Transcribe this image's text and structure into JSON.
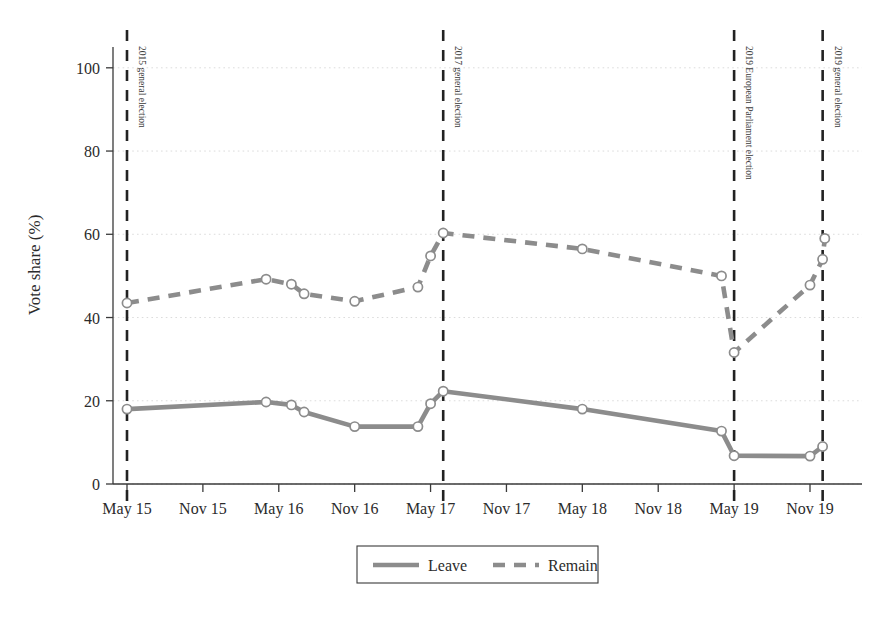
{
  "chart_data": {
    "type": "line",
    "title": "",
    "subtitle": "",
    "xlabel": "",
    "ylabel": "Vote share (%)",
    "ylim": [
      0,
      105
    ],
    "yticks": [
      0,
      20,
      40,
      60,
      80,
      100
    ],
    "ytick_labels": [
      "0",
      "20",
      "40",
      "60",
      "80",
      "100"
    ],
    "xlim": [
      "2015-02",
      "2020-01"
    ],
    "xticks": [
      "May 15",
      "Nov 15",
      "May 16",
      "Nov 16",
      "May 17",
      "Nov 17",
      "May 18",
      "Nov 18",
      "May 19",
      "Nov 19"
    ],
    "grid": "horizontal-dotted",
    "legend_position": "bottom-center",
    "series": [
      {
        "name": "Leave",
        "color": "#8c8c8c",
        "style": "solid",
        "marker": "circle-open",
        "points": [
          {
            "x": "May 15",
            "y": 18.0
          },
          {
            "x": "Apr 16",
            "y": 19.7
          },
          {
            "x": "Jun 16",
            "y": 19.0
          },
          {
            "x": "Jul 16",
            "y": 17.3
          },
          {
            "x": "Nov 16",
            "y": 13.8
          },
          {
            "x": "Apr 17",
            "y": 13.8
          },
          {
            "x": "May 17",
            "y": 19.3
          },
          {
            "x": "Jun 17",
            "y": 22.3
          },
          {
            "x": "May 18",
            "y": 18.0
          },
          {
            "x": "Apr 19",
            "y": 12.7
          },
          {
            "x": "May 19",
            "y": 6.8
          },
          {
            "x": "Nov 19",
            "y": 6.7
          },
          {
            "x": "Dec 19",
            "y": 9.0
          }
        ]
      },
      {
        "name": "Remain",
        "color": "#8c8c8c",
        "style": "dashed",
        "marker": "circle-open",
        "points": [
          {
            "x": "May 15",
            "y": 43.5
          },
          {
            "x": "Apr 16",
            "y": 49.2
          },
          {
            "x": "Jun 16",
            "y": 48.0
          },
          {
            "x": "Jul 16",
            "y": 45.7
          },
          {
            "x": "Nov 16",
            "y": 43.9
          },
          {
            "x": "Apr 17",
            "y": 47.3
          },
          {
            "x": "May 17",
            "y": 54.8
          },
          {
            "x": "Jun 17",
            "y": 60.3
          },
          {
            "x": "May 18",
            "y": 56.5
          },
          {
            "x": "Apr 19",
            "y": 50.0
          },
          {
            "x": "May 19",
            "y": 31.6
          },
          {
            "x": "Nov 19",
            "y": 47.8
          },
          {
            "x": "Dec 19",
            "y": 54.0
          },
          {
            "x": "Dec 19b",
            "y": 59.0
          }
        ]
      }
    ],
    "annotations": [
      {
        "label": "2015 general election",
        "x": "May 15",
        "style": "vertical-dashed"
      },
      {
        "label": "2017 general election",
        "x": "Jun 17",
        "style": "vertical-dashed"
      },
      {
        "label": "2019 European Parliament election",
        "x": "May 19",
        "style": "vertical-dashed"
      },
      {
        "label": "2019 general election",
        "x": "Dec 19",
        "style": "vertical-dashed"
      }
    ],
    "legend": [
      {
        "label": "Leave",
        "style": "solid",
        "color": "#8c8c8c"
      },
      {
        "label": "Remain",
        "style": "dashed",
        "color": "#8c8c8c"
      }
    ]
  }
}
